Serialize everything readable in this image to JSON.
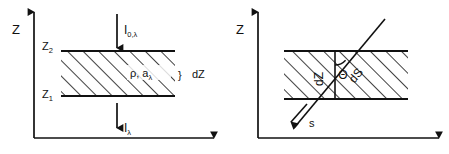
{
  "figure": {
    "background_color": "#ffffff",
    "line_color": "#111111",
    "panels": [
      {
        "id": "left",
        "name": "normal-incidence-slab",
        "axes": {
          "vertical_label": "Z",
          "horizontal_label": ""
        },
        "tick_labels": [
          {
            "base": "Z",
            "sub": "2"
          },
          {
            "base": "Z",
            "sub": "1"
          }
        ],
        "incoming_flux": {
          "base": "I",
          "sub": "0,λ"
        },
        "outgoing_flux": {
          "base": "I",
          "sub": "λ"
        },
        "slab_properties": {
          "base": "ρ, a",
          "sub": "λ"
        },
        "thickness_brace": "}",
        "thickness_label": "dZ"
      },
      {
        "id": "right",
        "name": "oblique-path-slab",
        "axes": {
          "vertical_label": "Z",
          "horizontal_label": ""
        },
        "vertical_segment_label": "dZ",
        "angle_label": "Θ",
        "path_label": "dS",
        "direction_label": "s"
      }
    ]
  }
}
